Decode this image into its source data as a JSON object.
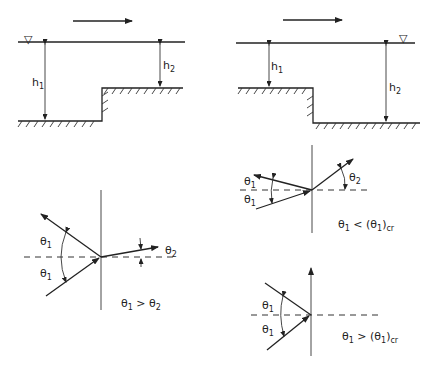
{
  "panels": {
    "step_up": {
      "flow_direction": "right",
      "water_surface_symbol": "▽",
      "labels": {
        "upstream_depth": "h",
        "upstream_depth_sub": "1",
        "downstream_depth": "h",
        "downstream_depth_sub": "2"
      }
    },
    "step_down": {
      "flow_direction": "right",
      "water_surface_symbol": "▽",
      "labels": {
        "upstream_depth": "h",
        "upstream_depth_sub": "1",
        "downstream_depth": "h",
        "downstream_depth_sub": "2"
      }
    },
    "refraction": {
      "angle_upper": "θ",
      "angle_upper_sub": "1",
      "angle_lower": "θ",
      "angle_lower_sub": "1",
      "angle_transmitted": "θ",
      "angle_transmitted_sub": "2",
      "condition": {
        "a": "θ",
        "a_sub": "1",
        "op": " > ",
        "b": "θ",
        "b_sub": "2"
      }
    },
    "subcritical": {
      "angle_upper": "θ",
      "angle_upper_sub": "1",
      "angle_lower": "θ",
      "angle_lower_sub": "1",
      "angle_transmitted": "θ",
      "angle_transmitted_sub": "2",
      "condition": {
        "a": "θ",
        "a_sub": "1",
        "op": " < (",
        "b": "θ",
        "b_sub": "1",
        "close": ")",
        "cr": "cr"
      }
    },
    "supercritical": {
      "angle_upper": "θ",
      "angle_upper_sub": "1",
      "angle_lower": "θ",
      "angle_lower_sub": "1",
      "condition": {
        "a": "θ",
        "a_sub": "1",
        "op": " > (",
        "b": "θ",
        "b_sub": "1",
        "close": ")",
        "cr": "cr"
      }
    }
  }
}
